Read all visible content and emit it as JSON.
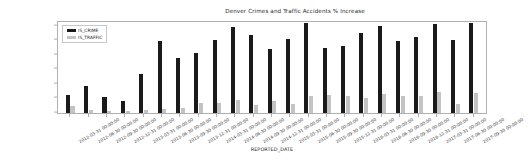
{
  "chart_data": {
    "type": "bar",
    "title": "Denver Crimes and Traffic Accidents % Increase",
    "xlabel": "REPORTED_DATE",
    "ylabel": "",
    "ylim": [
      0,
      125
    ],
    "yticks": [
      0,
      20,
      40,
      60,
      80,
      100,
      120
    ],
    "grid": false,
    "legend_position": "upper left",
    "categories": [
      "2012-03-31 00:00:00",
      "2012-06-30 00:00:00",
      "2012-09-30 00:00:00",
      "2012-12-31 00:00:00",
      "2013-03-31 00:00:00",
      "2013-06-30 00:00:00",
      "2013-09-30 00:00:00",
      "2013-12-31 00:00:00",
      "2014-03-31 00:00:00",
      "2014-06-30 00:00:00",
      "2014-09-30 00:00:00",
      "2014-12-31 00:00:00",
      "2015-03-31 00:00:00",
      "2015-06-30 00:00:00",
      "2015-09-30 00:00:00",
      "2015-12-31 00:00:00",
      "2016-03-31 00:00:00",
      "2016-06-30 00:00:00",
      "2016-09-30 00:00:00",
      "2016-12-31 00:00:00",
      "2017-03-31 00:00:00",
      "2017-06-30 00:00:00",
      "2017-09-30 00:00:00"
    ],
    "series": [
      {
        "name": "IS_CRIME",
        "color": "#1a1a1a",
        "values": [
          25,
          37,
          22,
          16,
          54,
          99,
          76,
          83,
          100,
          118,
          107,
          88,
          102,
          124,
          89,
          92,
          110,
          119,
          99,
          104,
          122,
          100,
          124
        ]
      },
      {
        "name": "IS_TRAFFIC",
        "color": "#c3c3c3",
        "values": [
          10,
          4,
          3,
          3,
          4,
          6,
          7,
          14,
          14,
          18,
          11,
          17,
          13,
          24,
          25,
          24,
          21,
          26,
          24,
          24,
          29,
          12,
          28
        ]
      }
    ]
  },
  "legend": {
    "entries": [
      {
        "label": "IS_CRIME"
      },
      {
        "label": "IS_TRAFFIC"
      }
    ]
  }
}
